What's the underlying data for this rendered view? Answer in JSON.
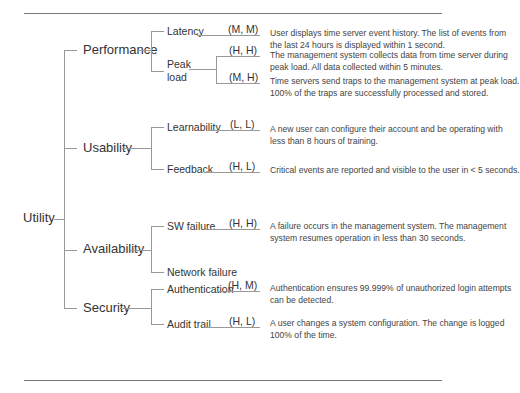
{
  "root": {
    "label": "Utility"
  },
  "categories": [
    {
      "label": "Performance"
    },
    {
      "label": "Usability"
    },
    {
      "label": "Availability"
    },
    {
      "label": "Security"
    }
  ],
  "attributes": [
    {
      "label": "Latency"
    },
    {
      "label": "Peak load"
    },
    {
      "label": "Learnability"
    },
    {
      "label": "Feedback"
    },
    {
      "label": "SW failure"
    },
    {
      "label": "Network failure"
    },
    {
      "label": "Authentication"
    },
    {
      "label": "Audit trail"
    }
  ],
  "scenarios": [
    {
      "priority": "(M, M)",
      "text": "User displays time server event history. The list of events from the last 24 hours is displayed within 1 second."
    },
    {
      "priority": "(H, H)",
      "text": "The management system collects data from time server during peak load. All data collected within 5 minutes."
    },
    {
      "priority": "(M, H)",
      "text": "Time servers send traps to the management system at peak load. 100% of the traps are successfully processed and stored."
    },
    {
      "priority": "(L, L)",
      "text": "A new user can configure their account and be operating with less than 8 hours of training."
    },
    {
      "priority": "(H, L)",
      "text": "Critical events are reported and visible to the user in < 5 seconds."
    },
    {
      "priority": "(H, H)",
      "text": "A failure occurs in the management system. The management system resumes operation in less than 30 seconds."
    },
    {
      "priority": "(H, M)",
      "text": "Authentication ensures 99.999% of unauthorized login attempts can be detected."
    },
    {
      "priority": "(H, L)",
      "text": "A user changes a system configuration. The change is logged 100% of the time."
    }
  ]
}
